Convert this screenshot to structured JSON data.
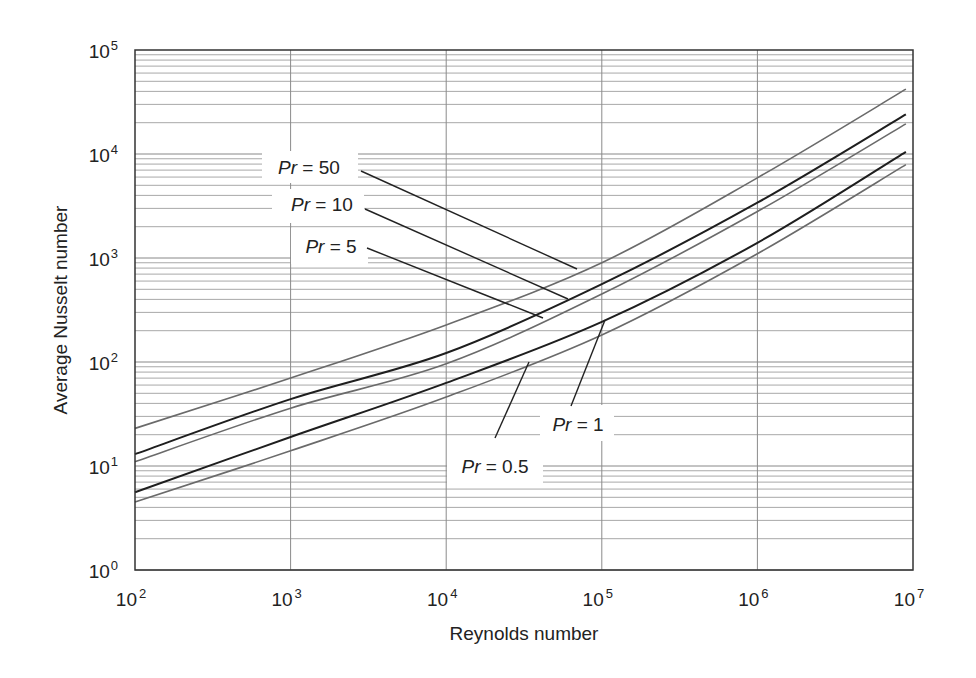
{
  "chart_data": {
    "type": "line",
    "title": "",
    "xlabel": "Reynolds number",
    "ylabel": "Average Nusselt number",
    "xscale": "log",
    "yscale": "log",
    "xlim": [
      100,
      10000000
    ],
    "ylim": [
      1,
      100000
    ],
    "grid": true,
    "legend_position": "inline-annotations",
    "x_tick_labels": [
      {
        "base": "10",
        "exp": "2",
        "value": 100
      },
      {
        "base": "10",
        "exp": "3",
        "value": 1000
      },
      {
        "base": "10",
        "exp": "4",
        "value": 10000
      },
      {
        "base": "10",
        "exp": "5",
        "value": 100000
      },
      {
        "base": "10",
        "exp": "6",
        "value": 1000000
      },
      {
        "base": "10",
        "exp": "7",
        "value": 10000000
      }
    ],
    "y_tick_labels": [
      {
        "base": "10",
        "exp": "0",
        "value": 1
      },
      {
        "base": "10",
        "exp": "1",
        "value": 10
      },
      {
        "base": "10",
        "exp": "2",
        "value": 100
      },
      {
        "base": "10",
        "exp": "3",
        "value": 1000
      },
      {
        "base": "10",
        "exp": "4",
        "value": 10000
      },
      {
        "base": "10",
        "exp": "5",
        "value": 100000
      }
    ],
    "x": [
      100,
      1000,
      10000,
      100000,
      1000000,
      9000000
    ],
    "series": [
      {
        "name": "Pr = 50",
        "label_prefix": "Pr",
        "label_value": "= 50",
        "color": "#6a6a6a",
        "width": 1.6,
        "values": [
          23,
          70,
          227,
          900,
          5900,
          42000
        ],
        "annotation": {
          "text_x": 309,
          "text_y": 167,
          "box": [
            262,
            151,
            96,
            32
          ],
          "leader": [
            [
              361,
              171
            ],
            [
              577,
              269
            ]
          ]
        }
      },
      {
        "name": "Pr = 10",
        "label_prefix": "Pr",
        "label_value": "= 10",
        "color": "#1e1e1e",
        "width": 2.0,
        "values": [
          13,
          44,
          122,
          560,
          3400,
          24000
        ],
        "annotation": {
          "text_x": 322,
          "text_y": 204,
          "box": [
            272,
            189,
            92,
            34
          ],
          "leader": [
            [
              365,
              209
            ],
            [
              568,
              299
            ]
          ]
        }
      },
      {
        "name": "Pr = 5",
        "label_prefix": "Pr",
        "label_value": "= 5",
        "color": "#6a6a6a",
        "width": 1.6,
        "values": [
          11,
          36,
          96,
          450,
          2800,
          19500
        ],
        "annotation": {
          "text_x": 331,
          "text_y": 246,
          "box": [
            291,
            228,
            77,
            36
          ],
          "leader": [
            [
              367,
              248
            ],
            [
              543,
              318
            ]
          ]
        }
      },
      {
        "name": "Pr = 1",
        "label_prefix": "Pr",
        "label_value": "= 1",
        "color": "#1e1e1e",
        "width": 2.0,
        "values": [
          5.6,
          19,
          63,
          243,
          1400,
          10500
        ],
        "annotation": {
          "text_x": 578,
          "text_y": 424,
          "box": [
            540,
            405,
            74,
            36
          ],
          "leader": [
            [
              571,
              406
            ],
            [
              605,
              320
            ]
          ]
        }
      },
      {
        "name": "Pr = 0.5",
        "label_prefix": "Pr",
        "label_value": "= 0.5",
        "color": "#6a6a6a",
        "width": 1.6,
        "values": [
          4.5,
          14,
          46,
          182,
          1100,
          7900
        ],
        "annotation": {
          "text_x": 495,
          "text_y": 466,
          "box": [
            447,
            445,
            96,
            42
          ],
          "leader": [
            [
              495,
              438
            ],
            [
              529,
              362
            ]
          ]
        }
      }
    ]
  },
  "layout": {
    "plot": {
      "left": 135,
      "top": 50,
      "right": 913,
      "bottom": 570
    }
  }
}
